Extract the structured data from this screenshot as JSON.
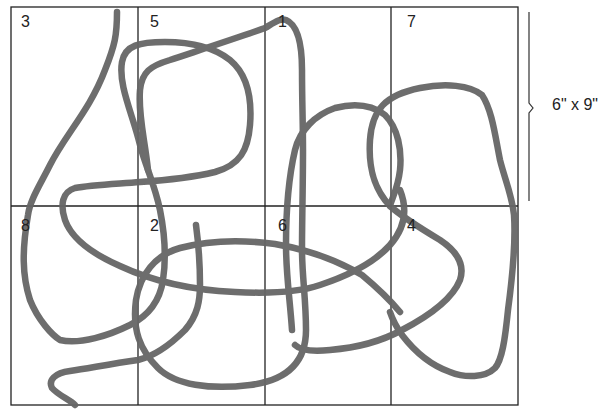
{
  "grid": {
    "rows": 2,
    "columns": 4,
    "line_color": "#222222",
    "cells": [
      {
        "label": "3",
        "row": 0,
        "col": 0
      },
      {
        "label": "5",
        "row": 0,
        "col": 1
      },
      {
        "label": "1",
        "row": 0,
        "col": 2
      },
      {
        "label": "7",
        "row": 0,
        "col": 3
      },
      {
        "label": "8",
        "row": 1,
        "col": 0
      },
      {
        "label": "2",
        "row": 1,
        "col": 1
      },
      {
        "label": "6",
        "row": 1,
        "col": 2
      },
      {
        "label": "4",
        "row": 1,
        "col": 3
      }
    ]
  },
  "scribble": {
    "stroke_color": "#666666"
  },
  "dimension": {
    "label": "6\" x 9\""
  }
}
